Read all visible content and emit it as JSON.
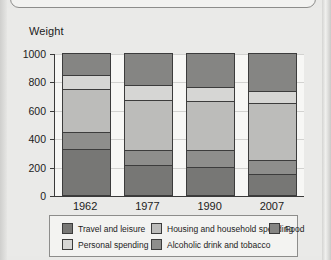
{
  "axis": {
    "y_label": "Weight",
    "y_ticks": [
      0,
      200,
      400,
      600,
      800,
      1000
    ],
    "x_ticks": [
      "1962",
      "1977",
      "1990",
      "2007"
    ]
  },
  "legend": {
    "items": [
      {
        "label": "Travel and leisure",
        "color": "#777775"
      },
      {
        "label": "Housing and household spending",
        "color": "#bcbcba"
      },
      {
        "label": "Food",
        "color": "#858583"
      },
      {
        "label": "Personal spending",
        "color": "#d6d6d4"
      },
      {
        "label": "Alcoholic drink and tobacco",
        "color": "#8e8e8c"
      }
    ]
  },
  "chart_data": {
    "type": "bar",
    "subtype": "stacked",
    "title": "",
    "xlabel": "",
    "ylabel": "Weight",
    "ylim": [
      0,
      1000
    ],
    "yticks": [
      0,
      200,
      400,
      600,
      800,
      1000
    ],
    "grid": true,
    "legend_position": "bottom",
    "categories": [
      "1962",
      "1977",
      "1990",
      "2007"
    ],
    "series": [
      {
        "name": "Travel and leisure",
        "color": "#777775",
        "values": [
          325,
          210,
          200,
          150
        ]
      },
      {
        "name": "Alcoholic drink and tobacco",
        "color": "#8e8e8c",
        "values": [
          120,
          110,
          115,
          100
        ]
      },
      {
        "name": "Housing and household spending",
        "color": "#bcbcba",
        "values": [
          300,
          350,
          345,
          400
        ]
      },
      {
        "name": "Personal spending",
        "color": "#d6d6d4",
        "values": [
          100,
          105,
          100,
          85
        ]
      },
      {
        "name": "Food",
        "color": "#858583",
        "values": [
          155,
          225,
          240,
          265
        ]
      }
    ],
    "cumulative_boundaries": {
      "1962": [
        325,
        445,
        745,
        845,
        1000
      ],
      "1977": [
        210,
        320,
        670,
        775,
        1000
      ],
      "1990": [
        200,
        315,
        660,
        760,
        1000
      ],
      "2007": [
        150,
        250,
        650,
        735,
        1000
      ]
    }
  }
}
